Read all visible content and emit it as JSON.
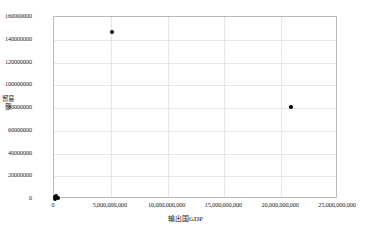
{
  "chart_data": {
    "type": "scatter",
    "title": "",
    "xlabel": "输出国GDP",
    "ylabel": "贸易额",
    "xlim": [
      0,
      25000000000
    ],
    "ylim": [
      0,
      160000000
    ],
    "grid": true,
    "legend": null,
    "marker": {
      "shape": "circle",
      "color": "#000000",
      "size": 4
    },
    "xticks": [
      0,
      5000000000,
      10000000000,
      15000000000,
      20000000000,
      25000000000
    ],
    "xtick_labels": [
      "0",
      "5,000,000,000",
      "10,000,000,000",
      "15,000,000,000",
      "20,000,000,000",
      "25,000,000,000"
    ],
    "yticks": [
      0,
      20000000,
      40000000,
      60000000,
      80000000,
      100000000,
      120000000,
      140000000,
      160000000
    ],
    "ytick_labels": [
      "0",
      "20000000",
      "40000000",
      "60000000",
      "80000000",
      "100000000",
      "120000000",
      "140000000",
      "160000000"
    ],
    "points": [
      {
        "x": 5100000000,
        "y": 147000000
      },
      {
        "x": 20900000000,
        "y": 81000000
      },
      {
        "x": 60000000,
        "y": 1500000
      },
      {
        "x": 190000000,
        "y": 2600000
      },
      {
        "x": 330000000,
        "y": 900000
      },
      {
        "x": 120000000,
        "y": 400000
      }
    ]
  },
  "colors": {
    "axis": "#b9b9b9",
    "grid": "#e6e6e6",
    "marker": "#000000",
    "text": "#1a1a1a",
    "background": "#ffffff"
  }
}
